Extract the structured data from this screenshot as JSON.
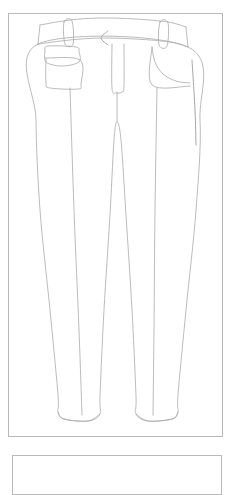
{
  "page": {
    "background_color": "#ffffff",
    "frame_border_color": "#b9b9b9",
    "line_color": "#a9a9a9",
    "accent_line_color": "#8f8f8f",
    "width": 235,
    "height": 463
  },
  "frames": {
    "main_frame_label": "Illustration Frame",
    "next_frame_label": "Next Illustration Frame"
  },
  "illustration": {
    "name": "womens-trousers-technical-flat",
    "view": "Front View",
    "garment_type": "Trousers",
    "fit": "Skinny Tapered",
    "rise": "Mid Rise",
    "parts": [
      {
        "name": "waistband",
        "label": "Waistband"
      },
      {
        "name": "belt-loop-left",
        "label": "Left Belt Loop"
      },
      {
        "name": "belt-loop-right",
        "label": "Right Belt Loop"
      },
      {
        "name": "center-fly",
        "label": "Center Front Fly"
      },
      {
        "name": "fly-notch",
        "label": "Fly V-Notch"
      },
      {
        "name": "patch-pocket-left",
        "label": "Left Patch Pocket"
      },
      {
        "name": "pocket-flap-left",
        "label": "Left Pocket Flap"
      },
      {
        "name": "slash-pocket-right",
        "label": "Right Curved Slash Pocket"
      },
      {
        "name": "left-leg",
        "label": "Left Leg"
      },
      {
        "name": "right-leg",
        "label": "Right Leg"
      },
      {
        "name": "crotch-seam",
        "label": "Crotch Seam"
      },
      {
        "name": "inseam-left",
        "label": "Left Inseam"
      },
      {
        "name": "inseam-right",
        "label": "Right Inseam"
      },
      {
        "name": "crease-left",
        "label": "Left Center Crease"
      },
      {
        "name": "crease-right",
        "label": "Right Center Crease"
      },
      {
        "name": "hem-left",
        "label": "Left Hem"
      },
      {
        "name": "hem-right",
        "label": "Right Hem"
      }
    ]
  },
  "chart_data": {
    "type": "line",
    "xlabel": "",
    "ylabel": "",
    "xlim": [
      0,
      235
    ],
    "ylim": [
      0,
      463
    ],
    "grid": false,
    "legend": "none",
    "series": [
      {
        "name": "waistband-top",
        "stroke": "#a9a9a9",
        "closed": false,
        "points": [
          [
            40,
            25
          ],
          [
            70,
            20
          ],
          [
            100,
            18
          ],
          [
            135,
            19
          ],
          [
            168,
            22
          ],
          [
            186,
            27
          ]
        ]
      },
      {
        "name": "waistband-bottom",
        "stroke": "#a9a9a9",
        "closed": false,
        "points": [
          [
            38,
            44
          ],
          [
            70,
            40
          ],
          [
            100,
            38
          ],
          [
            135,
            39
          ],
          [
            170,
            42
          ],
          [
            188,
            47
          ]
        ]
      },
      {
        "name": "waistband-left-edge",
        "stroke": "#a9a9a9",
        "closed": false,
        "points": [
          [
            40,
            25
          ],
          [
            38,
            44
          ]
        ]
      },
      {
        "name": "waistband-right-edge",
        "stroke": "#a9a9a9",
        "closed": false,
        "points": [
          [
            186,
            27
          ],
          [
            188,
            47
          ]
        ]
      },
      {
        "name": "belt-loop-left",
        "stroke": "#a9a9a9",
        "closed": true,
        "points": [
          [
            64,
            22
          ],
          [
            72,
            21
          ],
          [
            73,
            44
          ],
          [
            65,
            44
          ]
        ]
      },
      {
        "name": "belt-loop-right",
        "stroke": "#a9a9a9",
        "closed": true,
        "points": [
          [
            160,
            22
          ],
          [
            168,
            23
          ],
          [
            167,
            46
          ],
          [
            159,
            45
          ]
        ]
      },
      {
        "name": "fly-notch",
        "stroke": "#9a9a9a",
        "closed": false,
        "points": [
          [
            108,
            31
          ],
          [
            101,
            38
          ],
          [
            108,
            45
          ]
        ]
      },
      {
        "name": "center-fly",
        "stroke": "#a9a9a9",
        "closed": false,
        "points": [
          [
            112,
            44
          ],
          [
            112,
            88
          ],
          [
            116,
            93
          ],
          [
            122,
            92
          ],
          [
            124,
            86
          ],
          [
            124,
            44
          ]
        ]
      },
      {
        "name": "pocket-flap-left",
        "stroke": "#a9a9a9",
        "closed": false,
        "points": [
          [
            45,
            50
          ],
          [
            48,
            46
          ],
          [
            76,
            47
          ],
          [
            79,
            52
          ],
          [
            79,
            62
          ],
          [
            62,
            66
          ],
          [
            46,
            62
          ],
          [
            45,
            50
          ]
        ]
      },
      {
        "name": "patch-pocket-left",
        "stroke": "#a9a9a9",
        "closed": false,
        "points": [
          [
            46,
            58
          ],
          [
            80,
            60
          ],
          [
            81,
            84
          ],
          [
            78,
            89
          ],
          [
            50,
            88
          ],
          [
            46,
            83
          ],
          [
            46,
            58
          ]
        ]
      },
      {
        "name": "slash-pocket-right",
        "stroke": "#a9a9a9",
        "closed": false,
        "points": [
          [
            152,
            47
          ],
          [
            155,
            62
          ],
          [
            163,
            74
          ],
          [
            176,
            81
          ],
          [
            190,
            83
          ]
        ]
      },
      {
        "name": "slash-pocket-bag-right",
        "stroke": "#a9a9a9",
        "closed": false,
        "points": [
          [
            152,
            47
          ],
          [
            152,
            85
          ],
          [
            190,
            86
          ]
        ]
      },
      {
        "name": "silhouette-outline",
        "stroke": "#a9a9a9",
        "closed": true,
        "points": [
          [
            38,
            44
          ],
          [
            36,
            120
          ],
          [
            40,
            210
          ],
          [
            50,
            310
          ],
          [
            58,
            395
          ],
          [
            58,
            412
          ],
          [
            64,
            419
          ],
          [
            88,
            421
          ],
          [
            100,
            414
          ],
          [
            100,
            396
          ],
          [
            104,
            310
          ],
          [
            110,
            215
          ],
          [
            114,
            140
          ],
          [
            117,
            122
          ],
          [
            121,
            140
          ],
          [
            126,
            215
          ],
          [
            132,
            310
          ],
          [
            136,
            396
          ],
          [
            136,
            414
          ],
          [
            148,
            421
          ],
          [
            172,
            419
          ],
          [
            178,
            412
          ],
          [
            178,
            395
          ],
          [
            186,
            310
          ],
          [
            196,
            210
          ],
          [
            200,
            120
          ],
          [
            188,
            47
          ]
        ]
      },
      {
        "name": "crotch-seam",
        "stroke": "#a9a9a9",
        "closed": false,
        "points": [
          [
            117,
            92
          ],
          [
            117,
            122
          ]
        ]
      },
      {
        "name": "crease-left",
        "stroke": "#a9a9a9",
        "closed": false,
        "points": [
          [
            70,
            88
          ],
          [
            74,
            210
          ],
          [
            79,
            330
          ],
          [
            82,
            415
          ]
        ]
      },
      {
        "name": "crease-right",
        "stroke": "#a9a9a9",
        "closed": false,
        "points": [
          [
            157,
            88
          ],
          [
            155,
            210
          ],
          [
            154,
            330
          ],
          [
            153,
            415
          ]
        ]
      },
      {
        "name": "side-seam-right",
        "stroke": "#8f8f8f",
        "closed": false,
        "points": [
          [
            192,
            60
          ],
          [
            195,
            110
          ],
          [
            196,
            145
          ]
        ]
      },
      {
        "name": "hem-left",
        "stroke": "#a9a9a9",
        "closed": false,
        "points": [
          [
            58,
            412
          ],
          [
            64,
            419
          ],
          [
            88,
            421
          ],
          [
            100,
            414
          ]
        ]
      },
      {
        "name": "hem-right",
        "stroke": "#a9a9a9",
        "closed": false,
        "points": [
          [
            136,
            414
          ],
          [
            148,
            421
          ],
          [
            172,
            419
          ],
          [
            178,
            412
          ]
        ]
      }
    ]
  }
}
